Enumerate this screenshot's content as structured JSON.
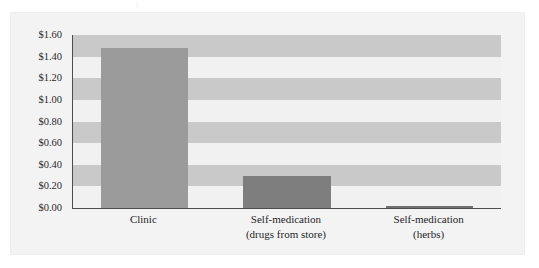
{
  "figure": {
    "top_remnant_text": "· ) ·",
    "background_color": "#f3f3f4",
    "frame_color": "#eeeeef"
  },
  "chart_data": {
    "type": "bar",
    "title": "",
    "subtitle": "",
    "xlabel": "",
    "ylabel": "",
    "categories": [
      "Clinic",
      "Self-medication (drugs from store)",
      "Self-medication (herbs)"
    ],
    "category_lines": [
      [
        "Clinic",
        ""
      ],
      [
        "Self-medication",
        "(drugs from store)"
      ],
      [
        "Self-medication",
        "(herbs)"
      ]
    ],
    "values": [
      1.48,
      0.3,
      0.02
    ],
    "value_labels": [
      "$1.48",
      "$0.30",
      "$0.02"
    ],
    "ylim": [
      0.0,
      1.6
    ],
    "ytick_step": 0.2,
    "ytick_labels": [
      "$1.60",
      "$1.40",
      "$1.20",
      "$1.00",
      "$0.80",
      "$0.60",
      "$0.40",
      "$0.20",
      "$0.00"
    ],
    "ytick_values": [
      1.6,
      1.4,
      1.2,
      1.0,
      0.8,
      0.6,
      0.4,
      0.2,
      0.0
    ],
    "grid": "horizontal-alternating-bands",
    "legend": "none",
    "legend_position": "none",
    "bar_colors": [
      "#9b9b9b",
      "#7e7e7e",
      "#6f6f6f"
    ],
    "band_color": "#c9c9c9",
    "plot_background": "#f1f1f1",
    "axis_color": "#4d4d4d",
    "annotations": []
  }
}
